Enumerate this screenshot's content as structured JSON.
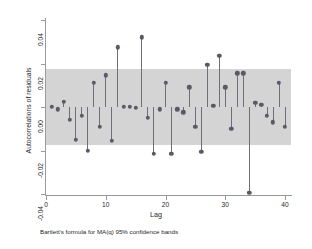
{
  "chart_data": {
    "type": "scatter",
    "title": "",
    "xlabel": "Lag",
    "ylabel": "Autocorrelations of residuals",
    "note": "Bartlett's formula for MA(q) 95% confidence bands",
    "xlim": [
      0,
      41
    ],
    "ylim": [
      -0.04,
      0.04
    ],
    "grid": false,
    "legend": "none",
    "xticks": [
      "0",
      "10",
      "20",
      "30",
      "40"
    ],
    "xtick_values": [
      0,
      10,
      20,
      30,
      40
    ],
    "yticks": [
      "0.04",
      "0.02",
      "0.00",
      "-0.02",
      "-0.04"
    ],
    "ytick_values": [
      0.04,
      0.02,
      0.0,
      -0.02,
      -0.04
    ],
    "confidence_band": {
      "label": "95% confidence band",
      "upper": 0.0174,
      "lower": -0.0176,
      "color": "#d4d4d4"
    },
    "marker_color": "#5a5a66",
    "stem_color": "#6e6e78",
    "x": [
      1,
      2,
      3,
      4,
      5,
      6,
      7,
      8,
      9,
      10,
      11,
      12,
      13,
      14,
      15,
      16,
      17,
      18,
      19,
      20,
      21,
      22,
      23,
      24,
      25,
      26,
      27,
      28,
      29,
      30,
      31,
      32,
      33,
      34,
      35,
      36,
      37,
      38,
      39,
      40
    ],
    "values": [
      0.0,
      -0.001,
      0.0025,
      -0.006,
      -0.015,
      -0.004,
      -0.02,
      0.011,
      -0.009,
      0.0145,
      -0.0155,
      0.0275,
      0.0,
      0.0,
      -0.0005,
      0.032,
      -0.005,
      -0.0215,
      -0.001,
      0.011,
      -0.0215,
      -0.001,
      -0.0025,
      0.009,
      -0.009,
      -0.0205,
      0.0195,
      0.0005,
      0.0235,
      0.009,
      -0.01,
      0.0155,
      0.0155,
      -0.0395,
      0.002,
      0.001,
      -0.004,
      -0.007,
      0.011,
      -0.009
    ]
  }
}
